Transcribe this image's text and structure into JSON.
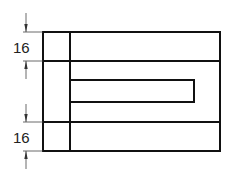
{
  "drawing": {
    "type": "technical-section-drawing",
    "line_color": "#111111",
    "dimension_color": "#333333",
    "dimensions": [
      {
        "id": "top-dimension",
        "label": "16"
      },
      {
        "id": "bottom-dimension",
        "label": "16"
      }
    ]
  }
}
